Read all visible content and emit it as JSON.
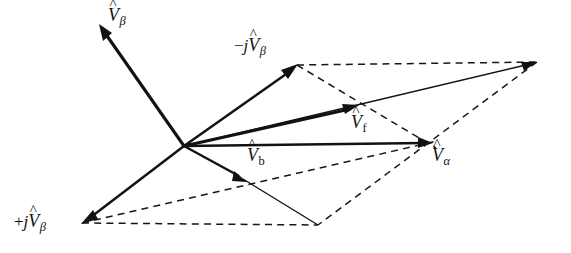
{
  "figure": {
    "type": "vector-phasor-diagram",
    "background_color": "#ffffff",
    "line_color": "#121212",
    "width": 571,
    "height": 253
  },
  "labels": {
    "v_beta": {
      "operator": "",
      "j": "",
      "symbol": "V",
      "hat": "^",
      "subscript": "β",
      "text": "V̂β",
      "x": 108,
      "y": 6
    },
    "minus_j_v_beta": {
      "operator": "−",
      "j": "j",
      "symbol": "V",
      "hat": "^",
      "subscript": "β",
      "text": "−jV̂β",
      "x": 234,
      "y": 36
    },
    "plus_j_v_beta": {
      "operator": "+",
      "j": "j",
      "symbol": "V",
      "hat": "^",
      "subscript": "β",
      "text": "+jV̂β",
      "x": 14,
      "y": 212
    },
    "v_f": {
      "operator": "",
      "j": "",
      "symbol": "V",
      "hat": "^",
      "subscript": "f",
      "text": "V̂f",
      "x": 351,
      "y": 113
    },
    "v_b": {
      "operator": "",
      "j": "",
      "symbol": "V",
      "hat": "^",
      "subscript": "b",
      "text": "V̂b",
      "x": 247,
      "y": 146
    },
    "v_alpha": {
      "operator": "",
      "j": "",
      "symbol": "V",
      "hat": "^",
      "subscript": "α",
      "text": "V̂α",
      "x": 432,
      "y": 146
    }
  },
  "geometry": {
    "origin": {
      "x": 184,
      "y": 146
    },
    "points": {
      "v_beta_tip": {
        "x": 100,
        "y": 25
      },
      "minus_j_v_beta_tip": {
        "x": 297,
        "y": 65
      },
      "plus_j_v_beta_tip": {
        "x": 82,
        "y": 223
      },
      "v_f_tip": {
        "x": 358,
        "y": 105
      },
      "v_b_tip": {
        "x": 246,
        "y": 182
      },
      "v_alpha_tip": {
        "x": 432,
        "y": 143
      },
      "resultant_tip": {
        "x": 537,
        "y": 62
      },
      "lower_vertex": {
        "x": 318,
        "y": 225
      }
    },
    "solid_vectors": [
      {
        "name": "v-beta-vector",
        "from": "origin",
        "to": "v_beta_tip",
        "weight": "thick",
        "arrow": true
      },
      {
        "name": "minus-j-v-beta-vector",
        "from": "origin",
        "to": "minus_j_v_beta_tip",
        "weight": "med",
        "arrow": true
      },
      {
        "name": "plus-j-v-beta-vector",
        "from": "origin",
        "to": "plus_j_v_beta_tip",
        "weight": "med",
        "arrow": true
      },
      {
        "name": "v-f-vector",
        "from": "origin",
        "to": "v_f_tip",
        "weight": "thick",
        "arrow": true
      },
      {
        "name": "v-b-vector",
        "from": "origin",
        "to": "v_b_tip",
        "weight": "med",
        "arrow": true
      },
      {
        "name": "v-alpha-vector",
        "from": "origin",
        "to": "v_alpha_tip",
        "weight": "med",
        "arrow": true
      },
      {
        "name": "resultant-vector",
        "from": "origin",
        "to": "resultant_tip",
        "weight": "thin",
        "arrow": true
      },
      {
        "name": "v-b-extension-line",
        "from": "v_b_tip",
        "to": "lower_vertex",
        "weight": "thin",
        "arrow": false
      }
    ],
    "dashed_lines": [
      {
        "name": "upper-parallel-edge",
        "from": "minus_j_v_beta_tip",
        "to": "resultant_tip"
      },
      {
        "name": "upper-right-diagonal",
        "from": "minus_j_v_beta_tip",
        "to": "v_alpha_tip"
      },
      {
        "name": "right-lower-diagonal",
        "from": "resultant_tip",
        "to": "lower_vertex"
      },
      {
        "name": "lower-parallel-edge",
        "from": "plus_j_v_beta_tip",
        "to": "lower_vertex"
      },
      {
        "name": "lower-left-diagonal",
        "from": "plus_j_v_beta_tip",
        "to": "v_alpha_tip"
      },
      {
        "name": "alpha-to-lower-vertex",
        "from": "v_alpha_tip",
        "to": "lower_vertex"
      }
    ]
  }
}
